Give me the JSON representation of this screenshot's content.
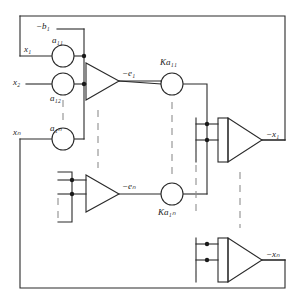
{
  "diagram": {
    "type": "schematic",
    "canvas": {
      "width": 301,
      "height": 306
    },
    "style": {
      "line_color": "#2a2a2a",
      "dash_color": "#8a8a8a",
      "background": "#ffffff"
    },
    "labels": {
      "b1": "−b₁",
      "a11": "a₁₁",
      "a12": "a₁₂",
      "a1n": "a₁ₙ",
      "x1_in": "x₁",
      "x2_in": "x₂",
      "xn_in": "xₙ",
      "e1": "−e₁",
      "en": "−eₙ",
      "Ka11": "Ka₁₁",
      "Ka1n": "Ka₁ₙ",
      "x1_out": "−x₁",
      "xn_out": "−xₙ"
    },
    "nodes": [
      {
        "name": "coefficient-pot-a11",
        "kind": "potentiometer",
        "label": "a₁₁",
        "cx": 63,
        "cy": 56,
        "r": 11
      },
      {
        "name": "coefficient-pot-a12",
        "kind": "potentiometer",
        "label": "a₁₂",
        "cx": 63,
        "cy": 84,
        "r": 11
      },
      {
        "name": "coefficient-pot-a1n",
        "kind": "potentiometer",
        "label": "a₁ₙ",
        "cx": 63,
        "cy": 139,
        "r": 11
      },
      {
        "name": "gain-pot-Ka11",
        "kind": "potentiometer",
        "label": "Ka₁₁",
        "cx": 172,
        "cy": 84,
        "r": 11
      },
      {
        "name": "gain-pot-Ka1n",
        "kind": "potentiometer",
        "label": "Ka₁ₙ",
        "cx": 172,
        "cy": 194,
        "r": 11
      },
      {
        "name": "summing-amplifier-e1",
        "kind": "amplifier",
        "label": "−e₁",
        "x": 86,
        "y": 63,
        "w": 33,
        "h": 37
      },
      {
        "name": "summing-amplifier-en",
        "kind": "amplifier",
        "label": "−eₙ",
        "x": 86,
        "y": 175,
        "w": 33,
        "h": 37
      },
      {
        "name": "integrator-x1",
        "kind": "integrator",
        "label": "−x₁",
        "x": 218,
        "y": 118,
        "w": 44,
        "h": 44
      },
      {
        "name": "integrator-xn",
        "kind": "integrator",
        "label": "−xₙ",
        "x": 218,
        "y": 238,
        "w": 44,
        "h": 44
      }
    ],
    "junction_dots": [
      {
        "name": "junction-a11-bus",
        "cx": 84,
        "cy": 56
      },
      {
        "name": "junction-a12-bus",
        "cx": 84,
        "cy": 84
      },
      {
        "name": "junction-ampn-in-1",
        "cx": 72,
        "cy": 180
      },
      {
        "name": "junction-ampn-in-2",
        "cx": 72,
        "cy": 194
      },
      {
        "name": "junction-int1-in-1",
        "cx": 207,
        "cy": 124
      },
      {
        "name": "junction-int1-in-2",
        "cx": 207,
        "cy": 140
      },
      {
        "name": "junction-intn-in-1",
        "cx": 207,
        "cy": 244
      },
      {
        "name": "junction-intn-in-2",
        "cx": 207,
        "cy": 260
      }
    ],
    "vertical_ellipses": [
      {
        "name": "ellipsis-coefficient-column",
        "x": 63,
        "y1": 100,
        "y2": 126
      },
      {
        "name": "ellipsis-amplifier-column",
        "x": 98,
        "y1": 108,
        "y2": 168
      },
      {
        "name": "ellipsis-gain-column",
        "x": 172,
        "y1": 102,
        "y2": 176
      },
      {
        "name": "ellipsis-bus-column",
        "x": 196,
        "y1": 152,
        "y2": 210
      },
      {
        "name": "ellipsis-integrator-column",
        "x": 240,
        "y1": 172,
        "y2": 228
      },
      {
        "name": "ellipsis-amp1-bracket",
        "x": 58,
        "y1": 198,
        "y2": 216
      },
      {
        "name": "ellipsis-int1-bracket",
        "x": 196,
        "y1": 262,
        "y2": 280
      }
    ]
  }
}
